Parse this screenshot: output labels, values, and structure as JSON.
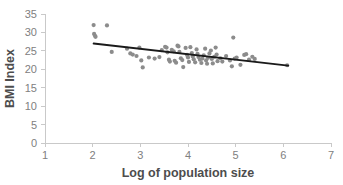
{
  "chart_data": {
    "type": "scatter",
    "title": "",
    "xlabel": "Log of population size",
    "ylabel": "BMI Index",
    "xlim": [
      1,
      7
    ],
    "ylim": [
      0,
      35
    ],
    "xticks": [
      1,
      2,
      3,
      4,
      5,
      6,
      7
    ],
    "yticks": [
      0,
      5,
      10,
      15,
      20,
      25,
      30,
      35
    ],
    "xtick_labels": [
      "1",
      "2",
      "3",
      "4",
      "5",
      "6",
      "7"
    ],
    "ytick_labels": [
      "0",
      "5",
      "10",
      "15",
      "20",
      "25",
      "30",
      "35"
    ],
    "grid": false,
    "legend": false,
    "point_color": "#8c8c8c",
    "trendline_color": "#1a1a1a",
    "axis_color": "#c9c9c9",
    "tick_label_color": "#808080",
    "axis_title_color": "#4d4d4d",
    "points": [
      [
        2.02,
        32.0
      ],
      [
        2.3,
        31.9
      ],
      [
        2.03,
        29.6
      ],
      [
        2.05,
        29.1
      ],
      [
        2.06,
        28.8
      ],
      [
        2.4,
        24.7
      ],
      [
        2.72,
        25.6
      ],
      [
        2.79,
        24.3
      ],
      [
        2.84,
        24.0
      ],
      [
        2.92,
        23.6
      ],
      [
        2.98,
        25.9
      ],
      [
        3.02,
        22.4
      ],
      [
        3.05,
        20.5
      ],
      [
        3.18,
        23.2
      ],
      [
        3.3,
        22.9
      ],
      [
        3.4,
        23.3
      ],
      [
        3.45,
        25.2
      ],
      [
        3.52,
        26.1
      ],
      [
        3.55,
        25.9
      ],
      [
        3.57,
        24.6
      ],
      [
        3.6,
        22.6
      ],
      [
        3.62,
        22.1
      ],
      [
        3.66,
        25.3
      ],
      [
        3.7,
        24.9
      ],
      [
        3.72,
        22.3
      ],
      [
        3.75,
        21.8
      ],
      [
        3.78,
        26.4
      ],
      [
        3.8,
        26.2
      ],
      [
        3.82,
        24.7
      ],
      [
        3.85,
        23.0
      ],
      [
        3.88,
        22.5
      ],
      [
        3.9,
        20.6
      ],
      [
        3.95,
        25.8
      ],
      [
        3.98,
        23.9
      ],
      [
        4.0,
        23.2
      ],
      [
        4.02,
        22.0
      ],
      [
        4.05,
        26.0
      ],
      [
        4.08,
        24.4
      ],
      [
        4.1,
        23.5
      ],
      [
        4.12,
        22.7
      ],
      [
        4.15,
        21.9
      ],
      [
        4.18,
        25.4
      ],
      [
        4.2,
        24.2
      ],
      [
        4.22,
        23.3
      ],
      [
        4.25,
        22.6
      ],
      [
        4.28,
        21.7
      ],
      [
        4.3,
        22.9
      ],
      [
        4.33,
        23.8
      ],
      [
        4.36,
        25.6
      ],
      [
        4.38,
        22.4
      ],
      [
        4.4,
        21.5
      ],
      [
        4.42,
        23.1
      ],
      [
        4.45,
        24.3
      ],
      [
        4.48,
        25.1
      ],
      [
        4.5,
        22.8
      ],
      [
        4.52,
        21.6
      ],
      [
        4.55,
        23.4
      ],
      [
        4.58,
        25.9
      ],
      [
        4.6,
        24.0
      ],
      [
        4.62,
        22.2
      ],
      [
        4.68,
        23.0
      ],
      [
        4.72,
        22.1
      ],
      [
        4.8,
        23.6
      ],
      [
        4.88,
        22.4
      ],
      [
        4.92,
        20.8
      ],
      [
        4.95,
        28.6
      ],
      [
        4.98,
        22.9
      ],
      [
        5.02,
        23.2
      ],
      [
        5.1,
        21.2
      ],
      [
        5.18,
        23.9
      ],
      [
        5.22,
        24.1
      ],
      [
        5.28,
        22.6
      ],
      [
        5.35,
        23.4
      ],
      [
        5.4,
        22.8
      ],
      [
        6.08,
        21.1
      ]
    ],
    "trendline": {
      "x_start": 2.02,
      "y_start": 27.0,
      "x_end": 6.1,
      "y_end": 21.0,
      "slope": -1.47,
      "intercept": 29.97
    },
    "n_points": 75
  }
}
